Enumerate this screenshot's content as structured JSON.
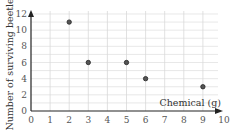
{
  "chart_data": {
    "type": "scatter",
    "title": "",
    "xlabel": "Chemical (g)",
    "ylabel": "Number of surviving beetles",
    "xlim": [
      0,
      10
    ],
    "ylim": [
      0,
      12
    ],
    "x_ticks": [
      "0",
      "1",
      "2",
      "3",
      "4",
      "5",
      "6",
      "7",
      "8",
      "9",
      "10"
    ],
    "y_ticks": [
      "0",
      "2",
      "4",
      "6",
      "8",
      "10",
      "12"
    ],
    "grid": true,
    "legend": null,
    "points": [
      {
        "x": 2,
        "y": 11
      },
      {
        "x": 3,
        "y": 6
      },
      {
        "x": 5,
        "y": 6
      },
      {
        "x": 6,
        "y": 4
      },
      {
        "x": 9,
        "y": 3
      }
    ]
  },
  "colors": {
    "grid": "#d9d9d9",
    "axis": "#222222",
    "point_fill": "#555555",
    "point_stroke": "#222222"
  }
}
